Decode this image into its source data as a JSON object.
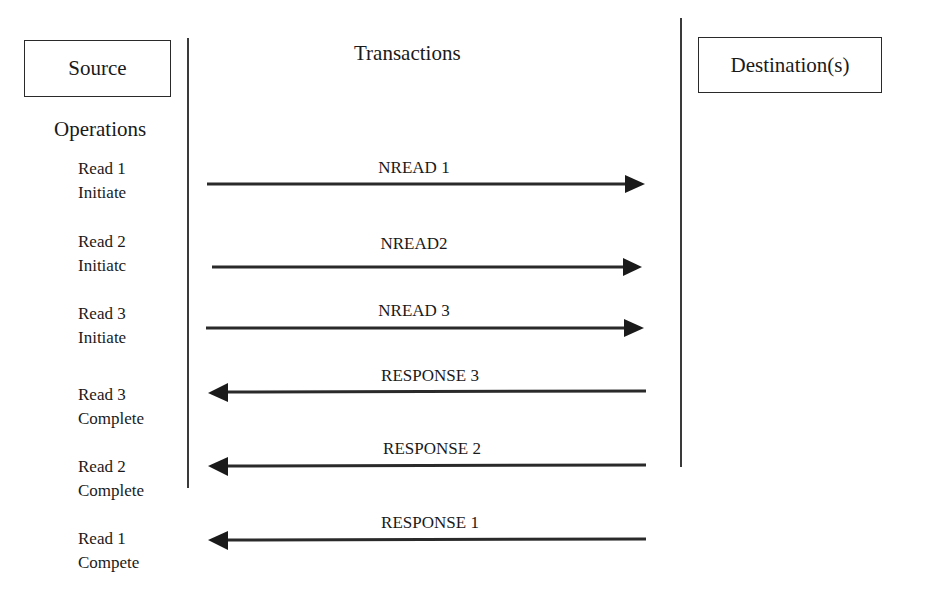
{
  "columns": {
    "source": "Source",
    "transactions": "Transactions",
    "destination": "Destination(s)",
    "operations_heading": "Operations"
  },
  "operations": [
    {
      "line1": "Read 1",
      "line2": "Initiate"
    },
    {
      "line1": "Read 2",
      "line2": "Initiatc"
    },
    {
      "line1": "Read 3",
      "line2": "Initiate"
    },
    {
      "line1": "Read 3",
      "line2": "Complete"
    },
    {
      "line1": "Read 2",
      "line2": "Complete"
    },
    {
      "line1": "Read 1",
      "line2": "Compete"
    }
  ],
  "messages": [
    {
      "label": "NREAD 1",
      "direction": "right"
    },
    {
      "label": "NREAD2",
      "direction": "right"
    },
    {
      "label": "NREAD 3",
      "direction": "right"
    },
    {
      "label": "RESPONSE 3",
      "direction": "left"
    },
    {
      "label": "RESPONSE 2",
      "direction": "left"
    },
    {
      "label": "RESPONSE 1",
      "direction": "left"
    }
  ],
  "colors": {
    "line": "#2a2a2a",
    "background": "#ffffff"
  }
}
